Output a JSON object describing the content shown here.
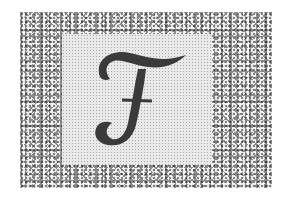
{
  "drop_cap": {
    "letter": "F",
    "style": "script-italic",
    "ink_color": "#3a3a3a"
  },
  "frame": {
    "texture": "cellular-pebble",
    "border_color": "#8a8a8a",
    "panel_color": "#e9e9e9"
  }
}
